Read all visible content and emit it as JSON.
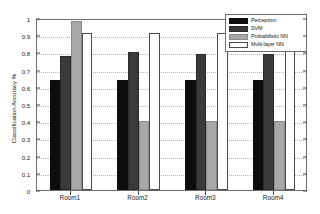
{
  "chart_data": {
    "type": "bar",
    "title": "",
    "subtitle": "",
    "xlabel": "",
    "ylabel": "Classification Accuracy %",
    "categories": [
      "Room1",
      "Room2",
      "Room3",
      "Room4"
    ],
    "series": [
      {
        "name": "Perceptron",
        "color": "#0d0d0d",
        "values": [
          0.64,
          0.64,
          0.64,
          0.64
        ]
      },
      {
        "name": "SVM",
        "color": "#3a3a3a",
        "values": [
          0.78,
          0.8,
          0.79,
          0.79
        ]
      },
      {
        "name": "Probabilistic NN",
        "color": "#a8a8a8",
        "values": [
          0.98,
          0.4,
          0.4,
          0.4
        ]
      },
      {
        "name": "Multi-layer NN",
        "color": "#ffffff",
        "values": [
          0.91,
          0.91,
          0.91,
          0.91
        ]
      }
    ],
    "ylim": [
      0,
      1
    ],
    "ytick_values": [
      0,
      0.1,
      0.2,
      0.3,
      0.4,
      0.5,
      0.6,
      0.7,
      0.8,
      0.9,
      1
    ],
    "ytick_labels": [
      "0",
      "0.1",
      "0.2",
      "0.3",
      "0.4",
      "0.5",
      "0.6",
      "0.7",
      "0.8",
      "0.9",
      "1"
    ],
    "grid": true,
    "grid_style": "dotted",
    "legend_position": "top-right-inside",
    "legend_entries": [
      "Perceptron",
      "SVM",
      "Probabilistic NN",
      "Multi-layer NN"
    ],
    "background_color": "#ffffff",
    "axis_color": "#6e6e6e"
  }
}
